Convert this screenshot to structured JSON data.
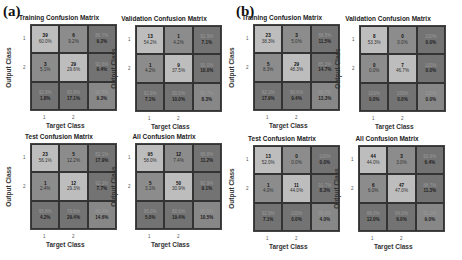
{
  "panels": [
    {
      "label": "(a)"
    },
    {
      "label": "(b)"
    }
  ],
  "axis": {
    "ylabel": "Output Class",
    "xlabel": "Target Class",
    "ticks": [
      "1",
      "2"
    ]
  },
  "matrices": [
    {
      "title": "Training Confusion Matrix",
      "cells": [
        {
          "n": "39",
          "p": "60.0%"
        },
        {
          "n": "6",
          "p": "9.2%"
        },
        {
          "s1": "86.7%",
          "s2": "9.2%"
        },
        {
          "n": "3",
          "p": "5.1%"
        },
        {
          "n": "29",
          "p": "29.6%"
        },
        {
          "s1": "90.6%",
          "s2": "9.4%"
        },
        {
          "s1": "92.9%",
          "s2": "1.8%"
        },
        {
          "s1": "82.9%",
          "s2": "17.1%"
        },
        {
          "s1": "90.7%",
          "s2": "9.3%"
        }
      ]
    },
    {
      "title": "Validation Confusion Matrix",
      "cells": [
        {
          "n": "13",
          "p": "54.2%"
        },
        {
          "n": "1",
          "p": "4.2%"
        },
        {
          "s1": "92.9%",
          "s2": "7.1%"
        },
        {
          "n": "1",
          "p": "4.2%"
        },
        {
          "n": "9",
          "p": "37.5%"
        },
        {
          "s1": "90.0%",
          "s2": "10.0%"
        },
        {
          "s1": "92.9%",
          "s2": "7.1%"
        },
        {
          "s1": "90.0%",
          "s2": "10.0%"
        },
        {
          "s1": "91.7%",
          "s2": "8.3%"
        }
      ]
    },
    {
      "title": "Test Confusion Matrix",
      "cells": [
        {
          "n": "23",
          "p": "56.1%"
        },
        {
          "n": "5",
          "p": "12.2%"
        },
        {
          "s1": "82.1%",
          "s2": "17.9%"
        },
        {
          "n": "1",
          "p": "2.4%"
        },
        {
          "n": "12",
          "p": "29.3%"
        },
        {
          "s1": "92.3%",
          "s2": "7.7%"
        },
        {
          "s1": "95.8%",
          "s2": "4.2%"
        },
        {
          "s1": "70.6%",
          "s2": "29.4%"
        },
        {
          "s1": "85.4%",
          "s2": "14.6%"
        }
      ]
    },
    {
      "title": "All Confusion Matrix",
      "cells": [
        {
          "n": "95",
          "p": "58.0%"
        },
        {
          "n": "12",
          "p": "7.4%"
        },
        {
          "s1": "88.8%",
          "s2": "11.2%"
        },
        {
          "n": "5",
          "p": "3.1%"
        },
        {
          "n": "50",
          "p": "30.9%"
        },
        {
          "s1": "90.9%",
          "s2": "9.1%"
        },
        {
          "s1": "95.0%",
          "s2": "5.0%"
        },
        {
          "s1": "80.6%",
          "s2": "19.4%"
        },
        {
          "s1": "89.5%",
          "s2": "10.5%"
        }
      ]
    },
    {
      "title": "Training Confusion Matrix",
      "cells": [
        {
          "n": "23",
          "p": "38.3%"
        },
        {
          "n": "3",
          "p": "5.0%"
        },
        {
          "s1": "88.5%",
          "s2": "11.5%"
        },
        {
          "n": "5",
          "p": "8.3%"
        },
        {
          "n": "29",
          "p": "48.3%"
        },
        {
          "s1": "85.3%",
          "s2": "14.7%"
        },
        {
          "s1": "82.1%",
          "s2": "17.9%"
        },
        {
          "s1": "90.6%",
          "s2": "9.4%"
        },
        {
          "s1": "86.7%",
          "s2": "13.3%"
        }
      ]
    },
    {
      "title": "Validation Confusion Matrix",
      "cells": [
        {
          "n": "8",
          "p": "53.3%"
        },
        {
          "n": "0",
          "p": "0.0%"
        },
        {
          "s1": "100%",
          "s2": "0.0%"
        },
        {
          "n": "0",
          "p": "0.0%"
        },
        {
          "n": "7",
          "p": "46.7%"
        },
        {
          "s1": "100%",
          "s2": "0.0%"
        },
        {
          "s1": "100%",
          "s2": "0.0%"
        },
        {
          "s1": "100%",
          "s2": "0.0%"
        },
        {
          "s1": "100%",
          "s2": "0.0%"
        }
      ]
    },
    {
      "title": "Test Confusion Matrix",
      "cells": [
        {
          "n": "13",
          "p": "52.0%"
        },
        {
          "n": "0",
          "p": "0.0%"
        },
        {
          "s1": "100%",
          "s2": "0.0%"
        },
        {
          "n": "1",
          "p": "4.0%"
        },
        {
          "n": "11",
          "p": "44.0%"
        },
        {
          "s1": "91.7%",
          "s2": "8.3%"
        },
        {
          "s1": "92.9%",
          "s2": "7.1%"
        },
        {
          "s1": "100%",
          "s2": "0.0%"
        },
        {
          "s1": "96.0%",
          "s2": "4.0%"
        }
      ]
    },
    {
      "title": "All Confusion Matrix",
      "cells": [
        {
          "n": "44",
          "p": "44.0%"
        },
        {
          "n": "3",
          "p": "3.0%"
        },
        {
          "s1": "93.6%",
          "s2": "6.4%"
        },
        {
          "n": "6",
          "p": "6.0%"
        },
        {
          "n": "47",
          "p": "47.0%"
        },
        {
          "s1": "88.7%",
          "s2": "11.3%"
        },
        {
          "s1": "88.0%",
          "s2": "12.0%"
        },
        {
          "s1": "94.0%",
          "s2": "6.0%"
        },
        {
          "s1": "91.0%",
          "s2": "9.0%"
        }
      ]
    }
  ],
  "chart_data": [
    {
      "type": "heatmap",
      "panel": "(a)",
      "title": "Training Confusion Matrix",
      "xlabel": "Target Class",
      "ylabel": "Output Class",
      "x": [
        "1",
        "2"
      ],
      "y": [
        "1",
        "2"
      ],
      "counts": [
        [
          39,
          6
        ],
        [
          3,
          29
        ]
      ]
    },
    {
      "type": "heatmap",
      "panel": "(a)",
      "title": "Validation Confusion Matrix",
      "xlabel": "Target Class",
      "ylabel": "Output Class",
      "x": [
        "1",
        "2"
      ],
      "y": [
        "1",
        "2"
      ],
      "counts": [
        [
          13,
          1
        ],
        [
          1,
          9
        ]
      ]
    },
    {
      "type": "heatmap",
      "panel": "(a)",
      "title": "Test Confusion Matrix",
      "xlabel": "Target Class",
      "ylabel": "Output Class",
      "x": [
        "1",
        "2"
      ],
      "y": [
        "1",
        "2"
      ],
      "counts": [
        [
          23,
          5
        ],
        [
          1,
          12
        ]
      ]
    },
    {
      "type": "heatmap",
      "panel": "(a)",
      "title": "All Confusion Matrix",
      "xlabel": "Target Class",
      "ylabel": "Output Class",
      "x": [
        "1",
        "2"
      ],
      "y": [
        "1",
        "2"
      ],
      "counts": [
        [
          95,
          12
        ],
        [
          5,
          50
        ]
      ]
    },
    {
      "type": "heatmap",
      "panel": "(b)",
      "title": "Training Confusion Matrix",
      "xlabel": "Target Class",
      "ylabel": "Output Class",
      "x": [
        "1",
        "2"
      ],
      "y": [
        "1",
        "2"
      ],
      "counts": [
        [
          23,
          3
        ],
        [
          5,
          29
        ]
      ]
    },
    {
      "type": "heatmap",
      "panel": "(b)",
      "title": "Validation Confusion Matrix",
      "xlabel": "Target Class",
      "ylabel": "Output Class",
      "x": [
        "1",
        "2"
      ],
      "y": [
        "1",
        "2"
      ],
      "counts": [
        [
          8,
          0
        ],
        [
          0,
          7
        ]
      ]
    },
    {
      "type": "heatmap",
      "panel": "(b)",
      "title": "Test Confusion Matrix",
      "xlabel": "Target Class",
      "ylabel": "Output Class",
      "x": [
        "1",
        "2"
      ],
      "y": [
        "1",
        "2"
      ],
      "counts": [
        [
          13,
          0
        ],
        [
          1,
          11
        ]
      ]
    },
    {
      "type": "heatmap",
      "panel": "(b)",
      "title": "All Confusion Matrix",
      "xlabel": "Target Class",
      "ylabel": "Output Class",
      "x": [
        "1",
        "2"
      ],
      "y": [
        "1",
        "2"
      ],
      "counts": [
        [
          44,
          3
        ],
        [
          6,
          47
        ]
      ]
    }
  ]
}
